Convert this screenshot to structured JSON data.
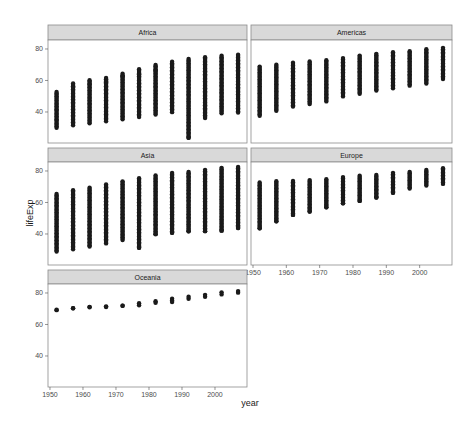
{
  "chart_data": {
    "type": "scatter",
    "title": "",
    "xlabel": "year",
    "ylabel": "lifeExp",
    "xlim": [
      1949.4,
      2009.7
    ],
    "ylim": [
      20.3,
      85.7
    ],
    "x_ticks": [
      1950,
      1960,
      1970,
      1980,
      1990,
      2000
    ],
    "y_ticks": [
      40,
      60,
      80
    ],
    "grid": false,
    "facet_by": "continent",
    "years": [
      1952,
      1957,
      1962,
      1967,
      1972,
      1977,
      1982,
      1987,
      1992,
      1997,
      2002,
      2007
    ],
    "panels": [
      {
        "name": "Africa",
        "ranges": [
          [
            30.0,
            52.7
          ],
          [
            31.6,
            58.1
          ],
          [
            32.8,
            60.2
          ],
          [
            34.1,
            61.6
          ],
          [
            35.4,
            64.3
          ],
          [
            36.8,
            67.1
          ],
          [
            38.4,
            69.9
          ],
          [
            39.9,
            71.9
          ],
          [
            23.6,
            73.6
          ],
          [
            36.1,
            74.8
          ],
          [
            39.2,
            75.7
          ],
          [
            39.6,
            76.4
          ]
        ],
        "outliers": [
          [
            1957,
            55.8
          ],
          [
            1962,
            57.7
          ],
          [
            1967,
            59.3
          ],
          [
            1972,
            62.4
          ],
          [
            1977,
            64.0
          ],
          [
            1982,
            66.0
          ],
          [
            1992,
            23.6
          ]
        ]
      },
      {
        "name": "Americas",
        "ranges": [
          [
            37.6,
            68.8
          ],
          [
            40.7,
            70.0
          ],
          [
            43.4,
            71.3
          ],
          [
            45.0,
            72.1
          ],
          [
            46.7,
            72.9
          ],
          [
            49.9,
            74.2
          ],
          [
            51.5,
            75.8
          ],
          [
            53.6,
            76.9
          ],
          [
            55.1,
            77.9
          ],
          [
            56.7,
            78.6
          ],
          [
            58.1,
            79.8
          ],
          [
            60.9,
            80.7
          ]
        ],
        "outliers": []
      },
      {
        "name": "Asia",
        "ranges": [
          [
            28.8,
            65.4
          ],
          [
            30.3,
            67.8
          ],
          [
            32.0,
            69.4
          ],
          [
            34.0,
            71.4
          ],
          [
            36.1,
            73.4
          ],
          [
            31.2,
            75.4
          ],
          [
            39.9,
            77.1
          ],
          [
            40.8,
            78.7
          ],
          [
            41.7,
            79.4
          ],
          [
            41.8,
            80.7
          ],
          [
            42.1,
            82.0
          ],
          [
            43.8,
            82.6
          ]
        ],
        "outliers": [
          [
            1977,
            31.2
          ],
          [
            1982,
            39.9
          ],
          [
            1987,
            40.8
          ],
          [
            1992,
            41.7
          ],
          [
            1997,
            41.8
          ],
          [
            2002,
            42.1
          ],
          [
            2007,
            43.8
          ]
        ]
      },
      {
        "name": "Europe",
        "ranges": [
          [
            43.6,
            72.7
          ],
          [
            48.1,
            73.5
          ],
          [
            52.1,
            73.7
          ],
          [
            54.3,
            74.2
          ],
          [
            57.0,
            74.7
          ],
          [
            59.5,
            76.1
          ],
          [
            61.0,
            76.99
          ],
          [
            63.1,
            77.4
          ],
          [
            66.1,
            78.8
          ],
          [
            68.8,
            79.4
          ],
          [
            70.8,
            80.6
          ],
          [
            71.8,
            81.8
          ]
        ],
        "outliers": [
          [
            1952,
            43.6
          ],
          [
            1957,
            48.1
          ],
          [
            1962,
            52.1
          ],
          [
            1967,
            54.3
          ],
          [
            1972,
            57.0
          ],
          [
            1977,
            59.5
          ],
          [
            1982,
            61.0
          ],
          [
            1987,
            63.1
          ],
          [
            1992,
            66.1
          ]
        ]
      },
      {
        "name": "Oceania",
        "ranges": [
          [
            69.1,
            69.4
          ],
          [
            70.3,
            70.3
          ],
          [
            70.9,
            71.2
          ],
          [
            71.1,
            71.5
          ],
          [
            71.9,
            71.9
          ],
          [
            72.2,
            73.5
          ],
          [
            73.8,
            74.7
          ],
          [
            74.3,
            76.3
          ],
          [
            76.3,
            77.6
          ],
          [
            77.6,
            78.8
          ],
          [
            79.1,
            80.4
          ],
          [
            80.2,
            81.2
          ]
        ],
        "outliers": []
      }
    ]
  }
}
